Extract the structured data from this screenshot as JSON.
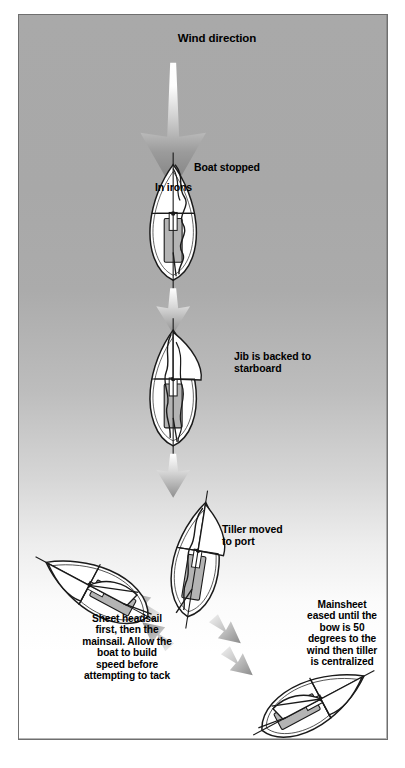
{
  "diagram": {
    "type": "sailing-maneuver-diagram",
    "frame": {
      "border_color": "#6f6f6f",
      "bg_top": "#a9a9a9",
      "bg_bottom": "#ffffff"
    }
  },
  "labels": {
    "wind_direction": "Wind direction",
    "boat_stopped": "Boat stopped",
    "in_irons": "In irons",
    "jib_backed": "Jib is backed to\nstarboard",
    "tiller_moved": "Tiller moved\nto port",
    "sheet_headsail": "Sheet headsail\nfirst, then the\nmainsail. Allow the\nboat to build\nspeed before\nattempting to tack",
    "mainsheet_eased": "Mainsheet\neased until the\nbow is 50\ndegrees to the\nwind then tiller\nis centralized"
  },
  "boats": [
    {
      "name": "boat-in-irons",
      "stage": 1,
      "heading_deg": 0,
      "state": "stopped head to wind, sails flapping"
    },
    {
      "name": "boat-jib-backed",
      "stage": 2,
      "heading_deg": 0,
      "state": "jib backed to starboard"
    },
    {
      "name": "boat-tiller-port",
      "stage": 3,
      "heading_deg": 8,
      "state": "tiller moved to port, bow falling off"
    },
    {
      "name": "boat-bearing-away-port",
      "stage": 4,
      "heading_deg": -58,
      "state": "sailing away on port tack"
    },
    {
      "name": "boat-bearing-away-starboard",
      "stage": 4,
      "heading_deg": 62,
      "state": "sailing away on starboard tack"
    }
  ],
  "arrows": {
    "wind_main": {
      "name": "wind-direction-arrow",
      "direction": "down",
      "fill": "white-to-grey-gradient"
    },
    "flow_small": [
      {
        "name": "flow-arrow-1",
        "direction": "down"
      },
      {
        "name": "flow-arrow-2",
        "direction": "down"
      }
    ],
    "spread": [
      {
        "name": "spread-arrow-left-outer",
        "direction": "up-left"
      },
      {
        "name": "spread-arrow-left-inner",
        "direction": "up-left"
      },
      {
        "name": "spread-arrow-right-inner",
        "direction": "down-right"
      },
      {
        "name": "spread-arrow-right-outer",
        "direction": "down-right"
      }
    ]
  },
  "colors": {
    "hull_fill": "#ffffff",
    "outline": "#1a1a1a",
    "cockpit_fill": "#b4b4b4",
    "arrow_dark": "#8d8d8d",
    "arrow_light": "#ffffff",
    "text": "#000000"
  }
}
